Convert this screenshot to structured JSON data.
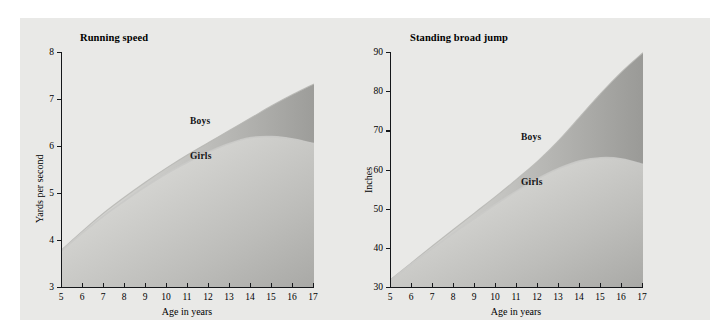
{
  "figure": {
    "background_color": "#e9e9e7",
    "page_color": "#ffffff",
    "axis_color": "#15171a"
  },
  "charts": {
    "running": {
      "title": "Running speed",
      "ylabel": "Yards per second",
      "xlabel": "Age in years",
      "y_ticks": [
        "3",
        "4",
        "5",
        "6",
        "7",
        "8"
      ],
      "x_ticks": [
        "5",
        "6",
        "7",
        "8",
        "9",
        "10",
        "11",
        "12",
        "13",
        "14",
        "15",
        "16",
        "17"
      ],
      "boys_label": "Boys",
      "girls_label": "Girls"
    },
    "jump": {
      "title": "Standing broad jump",
      "ylabel": "Inches",
      "xlabel": "Age in years",
      "y_ticks": [
        "30",
        "40",
        "50",
        "60",
        "70",
        "80",
        "90"
      ],
      "x_ticks": [
        "5",
        "6",
        "7",
        "8",
        "9",
        "10",
        "11",
        "12",
        "13",
        "14",
        "15",
        "16",
        "17"
      ],
      "boys_label": "Boys",
      "girls_label": "Girls"
    }
  },
  "chart_data": [
    {
      "type": "area",
      "title": "Running speed",
      "xlabel": "Age in years",
      "ylabel": "Yards per second",
      "xlim": [
        5,
        17
      ],
      "ylim": [
        3,
        8
      ],
      "grid": false,
      "legend_position": "inline-annotation",
      "x": [
        5,
        6,
        7,
        8,
        9,
        10,
        11,
        12,
        13,
        14,
        15,
        16,
        17
      ],
      "series": [
        {
          "name": "Boys",
          "values": [
            3.8,
            4.2,
            4.58,
            4.92,
            5.24,
            5.54,
            5.82,
            6.08,
            6.34,
            6.6,
            6.86,
            7.1,
            7.32
          ]
        },
        {
          "name": "Girls",
          "values": [
            3.78,
            4.16,
            4.52,
            4.84,
            5.14,
            5.42,
            5.66,
            5.88,
            6.06,
            6.18,
            6.2,
            6.15,
            6.05
          ]
        }
      ],
      "annotations": [
        {
          "text": "Boys",
          "x": 11.1,
          "y": 6.45
        },
        {
          "text": "Girls",
          "x": 11.1,
          "y": 5.7
        }
      ]
    },
    {
      "type": "area",
      "title": "Standing broad jump",
      "xlabel": "Age in years",
      "ylabel": "Inches",
      "xlim": [
        5,
        17
      ],
      "ylim": [
        30,
        90
      ],
      "grid": false,
      "legend_position": "inline-annotation",
      "x": [
        5,
        6,
        7,
        8,
        9,
        10,
        11,
        12,
        13,
        14,
        15,
        16,
        17
      ],
      "series": [
        {
          "name": "Boys",
          "values": [
            32.0,
            36.3,
            40.6,
            44.8,
            49.0,
            53.2,
            57.6,
            62.2,
            67.5,
            73.5,
            79.5,
            85.0,
            89.8
          ]
        },
        {
          "name": "Girls",
          "values": [
            31.8,
            36.0,
            40.0,
            43.9,
            47.6,
            51.2,
            54.6,
            57.7,
            60.3,
            62.2,
            63.0,
            62.7,
            61.3
          ]
        }
      ],
      "annotations": [
        {
          "text": "Boys",
          "x": 11.2,
          "y": 68.0
        },
        {
          "text": "Girls",
          "x": 11.2,
          "y": 56.5
        }
      ]
    }
  ]
}
